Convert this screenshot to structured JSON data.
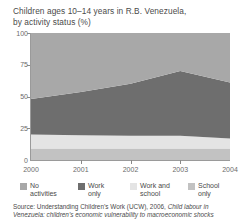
{
  "title": {
    "line1": "Children ages 10–14 years in R.B. Venezuela,",
    "line2": "by activity status (%)"
  },
  "source": {
    "prefix": "Source: Understanding Children’s Work (UCW), 2006, ",
    "italic1": "Child labour in",
    "italic2": "Venezuela: children’s economic vulnerability to macroeconomic shocks"
  },
  "axis": {
    "y_ticks": [
      "100",
      "75",
      "50",
      "25"
    ],
    "y_zero": "0",
    "x_ticks": [
      "2000",
      "2001",
      "2002",
      "2003",
      "2004"
    ]
  },
  "colors": {
    "no_activities": "#a8a8a8",
    "work_only": "#6e6e6e",
    "work_and_school": "#e4e4e4",
    "school_only": "#c2c2c2",
    "axis": "#9a9a9a",
    "text": "#4a4a4a"
  },
  "legend": [
    {
      "label": "No\nactivities",
      "color": "#a8a8a8",
      "x": 0
    },
    {
      "label": "Work\nonly",
      "color": "#6e6e6e",
      "x": 58
    },
    {
      "label": "Work and\nschool",
      "color": "#e4e4e4",
      "x": 110
    },
    {
      "label": "School\nonly",
      "color": "#c2c2c2",
      "x": 168
    }
  ],
  "chart_data": {
    "type": "area",
    "stacked": true,
    "title": "Children ages 10–14 years in R.B. Venezuela, by activity status (%)",
    "xlabel": "",
    "ylabel": "%",
    "x": [
      "2000",
      "2001",
      "2002",
      "2003",
      "2004"
    ],
    "ylim": [
      0,
      100
    ],
    "yticks": [
      0,
      25,
      50,
      75,
      100
    ],
    "grid": false,
    "legend_position": "bottom",
    "stack_order_bottom_to_top": [
      "School only",
      "Work and school",
      "Work only",
      "No activities"
    ],
    "series": [
      {
        "name": "School only",
        "color": "#c2c2c2",
        "values": [
          9,
          9,
          9,
          9,
          9
        ]
      },
      {
        "name": "Work and school",
        "color": "#e4e4e4",
        "values": [
          11,
          10.5,
          10,
          10,
          8
        ]
      },
      {
        "name": "Work only",
        "color": "#6e6e6e",
        "values": [
          28,
          34,
          41,
          51,
          44
        ]
      },
      {
        "name": "No activities",
        "color": "#a8a8a8",
        "values": [
          52,
          46.5,
          40,
          30,
          39
        ]
      }
    ],
    "cumulative_tops": {
      "School only": [
        9,
        9,
        9,
        9,
        9
      ],
      "Work and school": [
        20,
        19.5,
        19,
        19,
        17
      ],
      "Work only": [
        48,
        53.5,
        60,
        70,
        61
      ],
      "No activities": [
        100,
        100,
        100,
        100,
        100
      ]
    }
  }
}
